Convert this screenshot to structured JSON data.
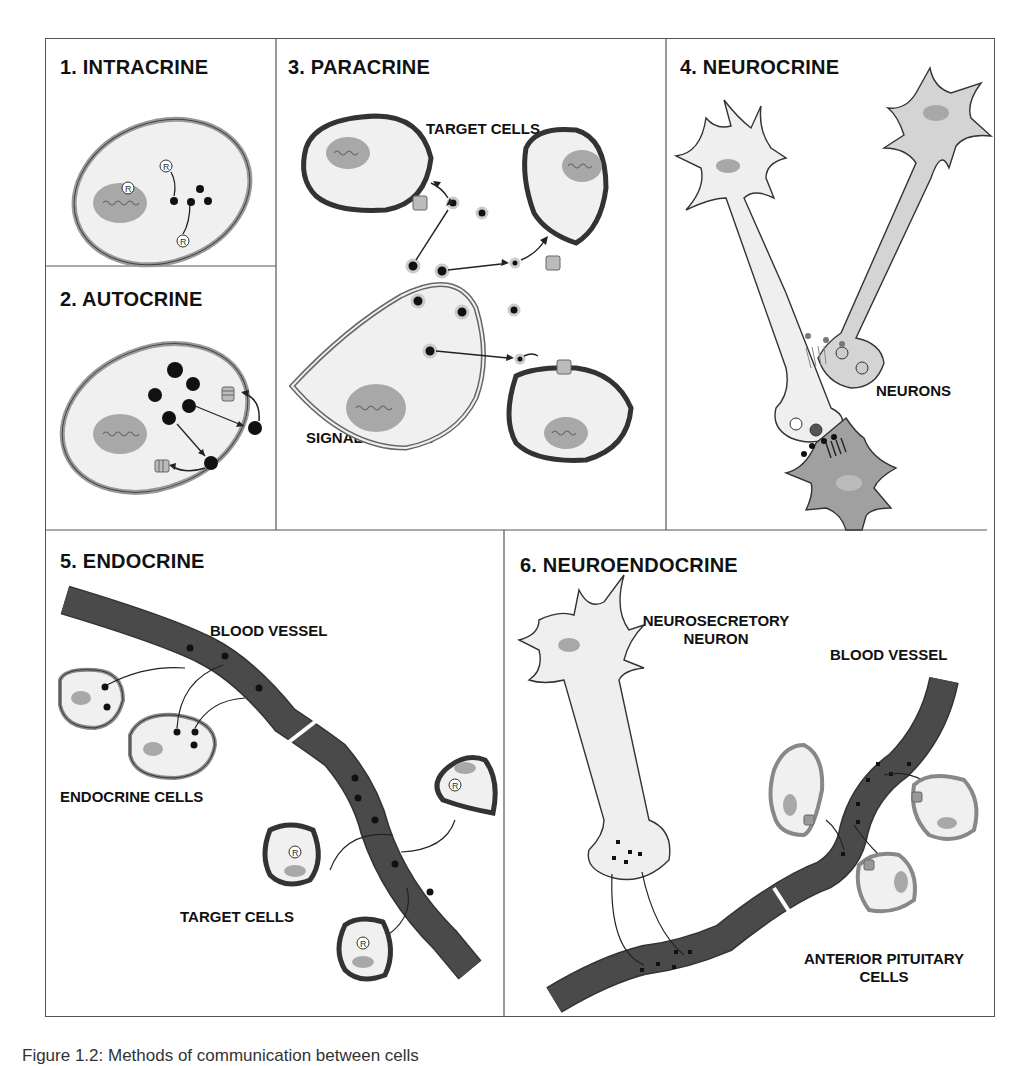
{
  "figure": {
    "panels": [
      {
        "id": "intracrine",
        "title": "1. INTRACRINE",
        "labels": []
      },
      {
        "id": "autocrine",
        "title": "2. AUTOCRINE",
        "labels": []
      },
      {
        "id": "paracrine",
        "title": "3. PARACRINE",
        "labels": [
          "TARGET CELLS",
          "SIGNALING CELL"
        ]
      },
      {
        "id": "neurocrine",
        "title": "4. NEUROCRINE",
        "labels": [
          "NEURONS"
        ]
      },
      {
        "id": "endocrine",
        "title": "5. ENDOCRINE",
        "labels": [
          "BLOOD VESSEL",
          "ENDOCRINE CELLS",
          "TARGET CELLS"
        ]
      },
      {
        "id": "neuroendocrine",
        "title": "6. NEUROENDOCRINE",
        "labels": [
          "NEUROSECRETORY NEURON",
          "BLOOD VESSEL",
          "ANTERIOR PITUITARY CELLS"
        ]
      }
    ],
    "receptor_symbol": "R",
    "caption": "Figure 1.2: Methods of communication between cells"
  },
  "colors": {
    "cell_fill": "#f0f0f0",
    "nucleus": "#a8a8a8",
    "membrane_dark": "#3a3a3a",
    "membrane_light": "#9a9a9a",
    "vessel": "#4a4a4a",
    "border": "#555555",
    "text": "#111111"
  }
}
